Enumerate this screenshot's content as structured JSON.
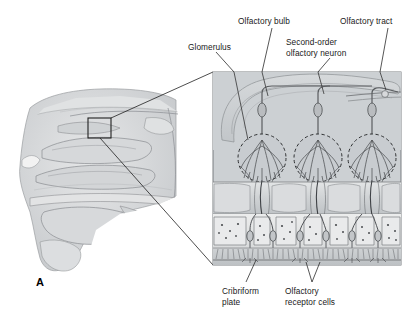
{
  "figure": {
    "panel_label": "A",
    "background": "#ffffff",
    "ink": "#1a1a1a"
  },
  "labels": {
    "glomerulus": "Glomerulus",
    "olfactory_bulb": "Olfactory bulb",
    "second_order": "Second-order\nolfactory neuron",
    "olfactory_tract": "Olfactory tract",
    "cribriform_plate": "Cribriform\nplate",
    "receptor_cells": "Olfactory\nreceptor cells"
  },
  "colors": {
    "panel_fill": "#ccd0d3",
    "panel_border": "#6e7275",
    "bone_fill": "#d8dadc",
    "epithelium_fill": "#e2e3e4",
    "cilia_fill": "#c7cacc",
    "head_tissue": "#d2d4d6",
    "head_outline": "#8c8f92",
    "leader": "#2b2b2b",
    "neuron": "#55585b",
    "dashed_glomerulus": "#2f3133"
  },
  "detail_panel": {
    "x": 213,
    "y": 72,
    "width": 188,
    "height": 193,
    "glomeruli_count": 3,
    "mitral_cells": 3,
    "layers": [
      "olfactory bulb",
      "glomerular layer",
      "cribriform plate",
      "olfactory epithelium",
      "cilia"
    ]
  },
  "head_diagram": {
    "callout_box": {
      "x": 88,
      "y": 118,
      "width": 23,
      "height": 20
    },
    "description": "sagittal section of nose and nasal cavity"
  }
}
